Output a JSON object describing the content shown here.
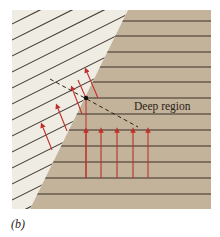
{
  "figure": {
    "panel_label": "(b)",
    "region_label": "Deep region",
    "colors": {
      "shallow_region": "#efece4",
      "deep_region": "#c3b39a",
      "wave_lines": "#3a3128",
      "arrows": "#c0302a",
      "dashed_line": "#2a2218"
    },
    "deep_wavefronts_y": [
      21,
      36,
      52,
      67,
      82,
      98,
      114,
      130,
      146,
      162,
      178,
      194
    ],
    "deep_arrows_x": [
      86,
      101,
      117,
      133,
      148
    ],
    "shallow_arrows": [
      {
        "x1": 52,
        "y1": 148,
        "x2": 43,
        "y2": 127
      },
      {
        "x1": 67,
        "y1": 130,
        "x2": 58,
        "y2": 108
      },
      {
        "x1": 82,
        "y1": 113,
        "x2": 71,
        "y2": 89
      },
      {
        "x1": 96,
        "y1": 97,
        "x2": 85,
        "y2": 72
      }
    ]
  }
}
